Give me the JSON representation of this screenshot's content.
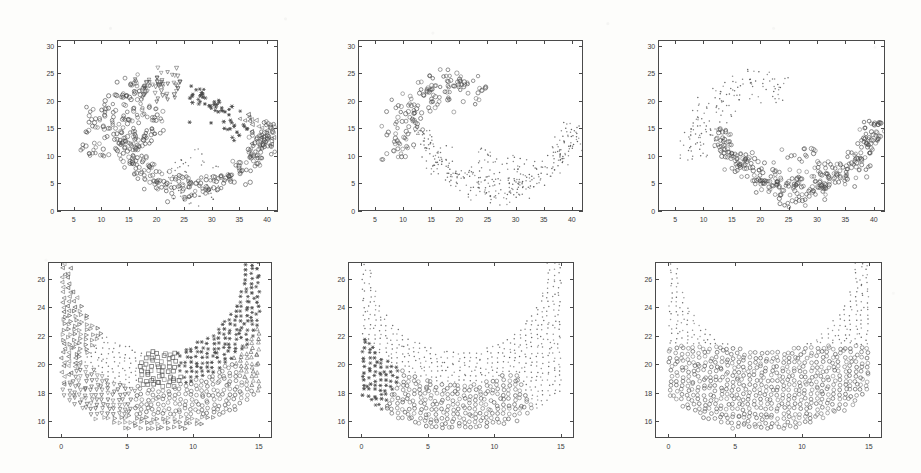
{
  "figure": {
    "title": "",
    "background_color": "#fdfdfb",
    "ink_color": "#4a4a4a",
    "panel_count": 6,
    "layout": "2 rows x 3 columns"
  },
  "chart_data": [
    {
      "id": "panel-top-left",
      "type": "scatter",
      "title": "",
      "xlabel": "",
      "ylabel": "",
      "xlim": [
        2,
        42
      ],
      "ylim": [
        0,
        31
      ],
      "xticks": [
        5,
        10,
        15,
        20,
        25,
        30,
        35,
        40
      ],
      "yticks": [
        0,
        5,
        10,
        15,
        20,
        25,
        30
      ],
      "grid": false,
      "legend": "none",
      "series": [
        {
          "name": "cluster-a",
          "marker": "circle",
          "n": 120,
          "region": "upper-left arc"
        },
        {
          "name": "cluster-b",
          "marker": "triangle-down",
          "n": 60,
          "region": "upper-middle arc"
        },
        {
          "name": "cluster-c",
          "marker": "star",
          "n": 55,
          "region": "middle band"
        },
        {
          "name": "cluster-d",
          "marker": "circle",
          "n": 260,
          "region": "lower crescent"
        },
        {
          "name": "cluster-e",
          "marker": "dot",
          "n": 70,
          "region": "lower-right scatter"
        }
      ]
    },
    {
      "id": "panel-top-middle",
      "type": "scatter",
      "title": "",
      "xlabel": "",
      "ylabel": "",
      "xlim": [
        2,
        42
      ],
      "ylim": [
        0,
        31
      ],
      "xticks": [
        5,
        10,
        15,
        20,
        25,
        30,
        35,
        40
      ],
      "yticks": [
        0,
        5,
        10,
        15,
        20,
        25,
        30
      ],
      "grid": false,
      "legend": "none",
      "series": [
        {
          "name": "upper-arc",
          "marker": "circle",
          "n": 150,
          "region": "upper crescent"
        },
        {
          "name": "lower-arc",
          "marker": "dot",
          "n": 300,
          "region": "lower crescent"
        }
      ]
    },
    {
      "id": "panel-top-right",
      "type": "scatter",
      "title": "",
      "xlabel": "",
      "ylabel": "",
      "xlim": [
        2,
        42
      ],
      "ylim": [
        0,
        31
      ],
      "xticks": [
        5,
        10,
        15,
        20,
        25,
        30,
        35,
        40
      ],
      "yticks": [
        0,
        5,
        10,
        15,
        20,
        25,
        30
      ],
      "grid": false,
      "legend": "none",
      "series": [
        {
          "name": "upper-arc",
          "marker": "dot",
          "n": 150,
          "region": "upper crescent"
        },
        {
          "name": "lower-arc",
          "marker": "circle",
          "n": 300,
          "region": "lower crescent"
        }
      ]
    },
    {
      "id": "panel-bottom-left",
      "type": "scatter",
      "title": "",
      "xlabel": "",
      "ylabel": "",
      "xlim": [
        -1,
        16
      ],
      "ylim": [
        14.8,
        27.2
      ],
      "xticks": [
        0,
        5,
        10,
        15
      ],
      "yticks": [
        16,
        18,
        20,
        22,
        24,
        26
      ],
      "grid": false,
      "legend": "none",
      "series": [
        {
          "name": "cluster-a",
          "marker": "triangle-left",
          "n": 45,
          "region": "left lobe"
        },
        {
          "name": "cluster-b",
          "marker": "triangle-down",
          "n": 45,
          "region": "upper-middle"
        },
        {
          "name": "cluster-c",
          "marker": "circle",
          "n": 80,
          "region": "upper-right lobe"
        },
        {
          "name": "cluster-d",
          "marker": "triangle-up",
          "n": 40,
          "region": "right lobe"
        },
        {
          "name": "cluster-e",
          "marker": "square",
          "n": 35,
          "region": "center"
        },
        {
          "name": "cluster-f",
          "marker": "star",
          "n": 60,
          "region": "lower-right"
        },
        {
          "name": "cluster-g",
          "marker": "dot",
          "n": 70,
          "region": "lower band"
        },
        {
          "name": "cluster-h",
          "marker": "triangle-right",
          "n": 30,
          "region": "bottom"
        }
      ]
    },
    {
      "id": "panel-bottom-middle",
      "type": "scatter",
      "title": "",
      "xlabel": "",
      "ylabel": "",
      "xlim": [
        -1,
        16
      ],
      "ylim": [
        14.8,
        27.2
      ],
      "xticks": [
        0,
        5,
        10,
        15
      ],
      "yticks": [
        16,
        18,
        20,
        22,
        24,
        26
      ],
      "grid": false,
      "legend": "none",
      "series": [
        {
          "name": "star-cluster",
          "marker": "star",
          "n": 28,
          "region": "upper-left"
        },
        {
          "name": "circle-cluster",
          "marker": "circle",
          "n": 95,
          "region": "upper-center"
        },
        {
          "name": "dot-cluster",
          "marker": "dot",
          "n": 180,
          "region": "outer band"
        }
      ]
    },
    {
      "id": "panel-bottom-right",
      "type": "scatter",
      "title": "",
      "xlabel": "",
      "ylabel": "",
      "xlim": [
        -1,
        16
      ],
      "ylim": [
        14.8,
        27.2
      ],
      "xticks": [
        0,
        5,
        10,
        15
      ],
      "yticks": [
        16,
        18,
        20,
        22,
        24,
        26
      ],
      "grid": false,
      "legend": "none",
      "series": [
        {
          "name": "upper-dots",
          "marker": "dot",
          "n": 150,
          "region": "upper region"
        },
        {
          "name": "lower-circles",
          "marker": "circle",
          "n": 180,
          "region": "lower crescent"
        }
      ]
    }
  ]
}
